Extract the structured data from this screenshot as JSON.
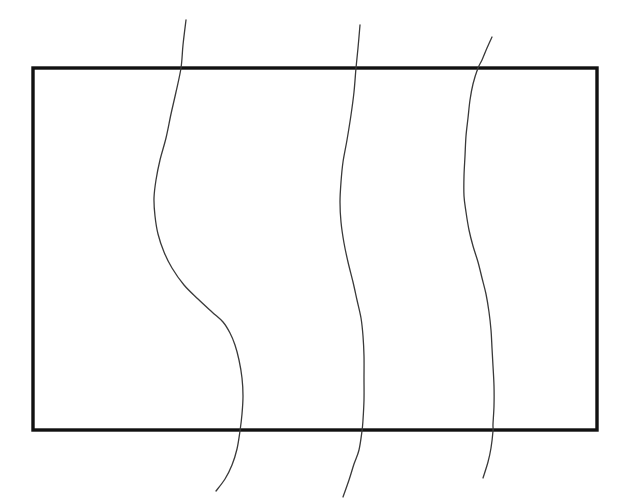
{
  "figure": {
    "canvas": {
      "width": 625,
      "height": 501,
      "background": "#ffffff"
    },
    "frame": {
      "name": "rectangle-border",
      "x": 33,
      "y": 68,
      "width": 564,
      "height": 362,
      "stroke_color": "#111111",
      "stroke_width": 3.4,
      "fill": "none"
    },
    "curves": [
      {
        "name": "wavy-curve-left",
        "stroke_color": "#3a3a3a",
        "stroke_width": 1.3,
        "start": {
          "x": 186,
          "y": 20
        },
        "end": {
          "x": 216,
          "y": 491
        },
        "points": [
          [
            186,
            20
          ],
          [
            183,
            45
          ],
          [
            181,
            68
          ],
          [
            176,
            92
          ],
          [
            171,
            114
          ],
          [
            166,
            138
          ],
          [
            160,
            160
          ],
          [
            156,
            180
          ],
          [
            154,
            198
          ],
          [
            155,
            216
          ],
          [
            158,
            234
          ],
          [
            164,
            252
          ],
          [
            172,
            268
          ],
          [
            184,
            285
          ],
          [
            198,
            299
          ],
          [
            212,
            312
          ],
          [
            223,
            322
          ],
          [
            230,
            333
          ],
          [
            235,
            345
          ],
          [
            239,
            360
          ],
          [
            242,
            378
          ],
          [
            243,
            396
          ],
          [
            242,
            414
          ],
          [
            240,
            431
          ],
          [
            237,
            449
          ],
          [
            232,
            465
          ],
          [
            225,
            479
          ],
          [
            216,
            491
          ]
        ],
        "path": "M186,20 C183,45 181,60 179,80 C175,105 166,132 159,160 C155,178 153,196 155,214 C157,233 164,252 175,270 C186,287 202,302 217,316 C227,326 233,337 237,352 C241,370 243,390 242,412 C241,431 239,451 234,467 C229,481 223,487 216,491"
      },
      {
        "name": "wavy-curve-middle",
        "stroke_color": "#3a3a3a",
        "stroke_width": 1.3,
        "start": {
          "x": 360,
          "y": 25
        },
        "end": {
          "x": 343,
          "y": 497
        },
        "points": [
          [
            360,
            25
          ],
          [
            358,
            48
          ],
          [
            356,
            68
          ],
          [
            354,
            92
          ],
          [
            351,
            115
          ],
          [
            347,
            140
          ],
          [
            343,
            162
          ],
          [
            341,
            182
          ],
          [
            340,
            202
          ],
          [
            341,
            222
          ],
          [
            344,
            243
          ],
          [
            348,
            262
          ],
          [
            353,
            282
          ],
          [
            357,
            300
          ],
          [
            361,
            318
          ],
          [
            363,
            336
          ],
          [
            364,
            356
          ],
          [
            364,
            378
          ],
          [
            364,
            400
          ],
          [
            363,
            420
          ],
          [
            362,
            431
          ],
          [
            359,
            450
          ],
          [
            354,
            464
          ],
          [
            349,
            480
          ],
          [
            343,
            497
          ]
        ],
        "path": "M360,25 C358,48 356,70 353,96 C349,124 343,150 341,178 C339,200 340,222 345,246 C350,270 357,292 361,315 C364,335 365,358 364,382 C364,405 363,422 361,440 C359,458 355,472 350,483 C347,490 345,494 343,497"
      },
      {
        "name": "wavy-curve-right",
        "stroke_color": "#3a3a3a",
        "stroke_width": 1.3,
        "start": {
          "x": 492,
          "y": 37
        },
        "end": {
          "x": 483,
          "y": 478
        },
        "points": [
          [
            492,
            37
          ],
          [
            487,
            48
          ],
          [
            482,
            60
          ],
          [
            478,
            68
          ],
          [
            473,
            84
          ],
          [
            470,
            100
          ],
          [
            468,
            118
          ],
          [
            466,
            136
          ],
          [
            465,
            156
          ],
          [
            464,
            176
          ],
          [
            464,
            196
          ],
          [
            466,
            212
          ],
          [
            469,
            230
          ],
          [
            473,
            246
          ],
          [
            478,
            262
          ],
          [
            482,
            278
          ],
          [
            486,
            294
          ],
          [
            489,
            312
          ],
          [
            491,
            330
          ],
          [
            492,
            348
          ],
          [
            493,
            366
          ],
          [
            494,
            386
          ],
          [
            494,
            406
          ],
          [
            493,
            424
          ],
          [
            493,
            431
          ],
          [
            491,
            448
          ],
          [
            488,
            462
          ],
          [
            483,
            478
          ]
        ],
        "path": "M492,37 C487,48 481,58 477,70 C471,88 467,108 465,130 C463,152 463,174 465,196 C467,218 473,240 480,264 C486,286 490,308 492,332 C494,356 495,380 494,404 C494,422 492,440 489,456 C487,467 485,473 483,478"
      }
    ]
  }
}
